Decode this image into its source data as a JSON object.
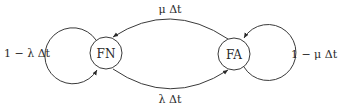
{
  "diagram": {
    "type": "state-transition",
    "nodes": [
      {
        "id": "FN",
        "label": "FN"
      },
      {
        "id": "FA",
        "label": "FA"
      }
    ],
    "edges": [
      {
        "from": "FN",
        "to": "FN",
        "label": "1 − λ Δt",
        "kind": "self-loop"
      },
      {
        "from": "FA",
        "to": "FN",
        "label": "μ Δt",
        "kind": "transition"
      },
      {
        "from": "FN",
        "to": "FA",
        "label": "λ Δt",
        "kind": "transition"
      },
      {
        "from": "FA",
        "to": "FA",
        "label": "1 − μ Δt",
        "kind": "self-loop"
      }
    ]
  }
}
